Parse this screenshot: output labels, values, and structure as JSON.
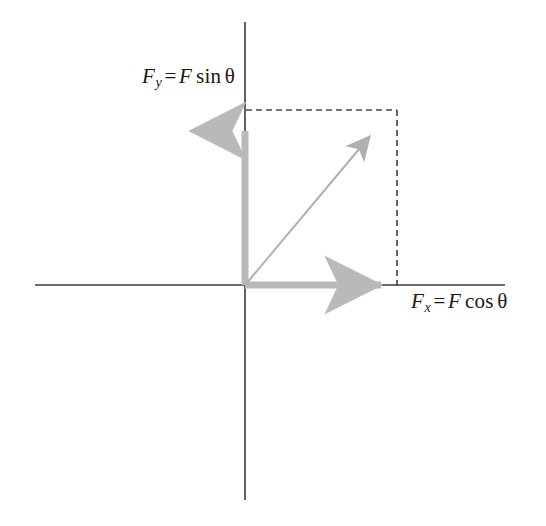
{
  "figure": {
    "width": 546,
    "height": 526,
    "background_color": "#ffffff"
  },
  "colors": {
    "axis": "#3a3a3a",
    "component_vector": "#b9b9b9",
    "resultant_vector": "#b0b0b0",
    "dashed_guide": "#4a4a4a",
    "label_text": "#1a1a1a"
  },
  "geometry": {
    "origin": {
      "x": 245,
      "y": 285
    },
    "corner": {
      "x": 397,
      "y": 110
    },
    "x_axis": {
      "start_x": 35,
      "end_x": 505,
      "y": 285
    },
    "y_axis": {
      "x": 245,
      "start_y": 22,
      "end_y": 500
    },
    "x_component_tip": {
      "x": 395,
      "y": 285
    },
    "y_component_tip": {
      "x": 245,
      "y": 118
    },
    "resultant_tip": {
      "x": 393,
      "y": 114
    },
    "component_stroke_width": 7,
    "resultant_stroke_width": 2,
    "axis_stroke_width": 1.6,
    "dash_pattern": "6 4"
  },
  "labels": {
    "y_component": {
      "symbol": "F",
      "subscript": "y",
      "equals": "=",
      "magnitude": "F",
      "function": "sin",
      "angle": "θ",
      "full_text": "F_y = F sin θ"
    },
    "x_component": {
      "symbol": "F",
      "subscript": "x",
      "equals": "=",
      "magnitude": "F",
      "function": "cos",
      "angle": "θ",
      "full_text": "F_x = F cos θ"
    }
  },
  "elements": {
    "x_axis_name": "horizontal-axis",
    "y_axis_name": "vertical-axis",
    "x_vector_name": "x-component-vector",
    "y_vector_name": "y-component-vector",
    "resultant_name": "resultant-force-vector",
    "guide_top_name": "dashed-guide-top",
    "guide_right_name": "dashed-guide-right"
  }
}
